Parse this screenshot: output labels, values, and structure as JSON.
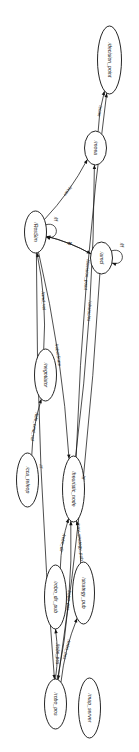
{
  "diagram": {
    "orientation": "rotated-90",
    "background_color": "#ffffff",
    "stroke_color": "#141414",
    "node_fill": "#ffffff",
    "nodes": [
      {
        "id": "decision_point",
        "label": "/decision_point",
        "cx": 60,
        "cy": 30,
        "rx": 34,
        "ry": 12
      },
      {
        "id": "moea",
        "label": "/moea",
        "cx": 148,
        "cy": 44,
        "rx": 17,
        "ry": 11
      },
      {
        "id": "amcl",
        "label": "/amcl",
        "cx": 258,
        "cy": 38,
        "rx": 16,
        "ry": 11
      },
      {
        "id": "RosSim",
        "label": "/RosSim",
        "cx": 232,
        "cy": 104,
        "rx": 21,
        "ry": 11
      },
      {
        "id": "negotiator",
        "label": "/negotiator",
        "cx": 375,
        "cy": 94,
        "rx": 26,
        "ry": 11
      },
      {
        "id": "heuristic_node",
        "label": "/heuristic_node",
        "cx": 489,
        "cy": 66,
        "rx": 33,
        "ry": 11
      },
      {
        "id": "cca_teleop",
        "label": "/cca_teleop",
        "cx": 480,
        "cy": 112,
        "rx": 27,
        "ry": 11
      },
      {
        "id": "strategy_pub",
        "label": "/strategy_pub",
        "cx": 593,
        "cy": 56,
        "rx": 31,
        "ry": 11
      },
      {
        "id": "robo_dir_pub",
        "label": "/robo_dir_pub",
        "cx": 597,
        "cy": 84,
        "rx": 32,
        "ry": 11
      },
      {
        "id": "map_server",
        "label": "/map_server",
        "cx": 708,
        "cy": 50,
        "rx": 30,
        "ry": 11
      },
      {
        "id": "robo_pos",
        "label": "/robo_pos",
        "cx": 704,
        "cy": 84,
        "rx": 25,
        "ry": 11
      }
    ],
    "edges": [
      {
        "id": "e1",
        "from": "moea",
        "to": "decision_point",
        "label": "/scan"
      },
      {
        "id": "e2",
        "from": "RosSim",
        "to": "moea",
        "label": "/scan"
      },
      {
        "id": "e3",
        "from": "amcl",
        "to": "amcl",
        "label": "/tf"
      },
      {
        "id": "e4",
        "from": "RosSim",
        "to": "RosSim",
        "label": "/tf"
      },
      {
        "id": "e5",
        "from": "RosSim",
        "to": "amcl",
        "label": "/tf"
      },
      {
        "id": "e6",
        "from": "amcl",
        "to": "RosSim",
        "label": "/tf"
      },
      {
        "id": "e7",
        "from": "heuristic_node",
        "to": "decision_point",
        "label": "/decision_point"
      },
      {
        "id": "e8",
        "from": "heuristic_node",
        "to": "moea",
        "label": "/obstacles"
      },
      {
        "id": "e9",
        "from": "RosSim",
        "to": "heuristic_node",
        "label": "/robotState"
      },
      {
        "id": "e10",
        "from": "negotiator",
        "to": "RosSim",
        "label": "/cmd_vel"
      },
      {
        "id": "e11",
        "from": "cca_teleop",
        "to": "negotiator",
        "label": "/tele_cmd_vel"
      },
      {
        "id": "e12",
        "from": "strategy_pub",
        "to": "heuristic_node",
        "label": "/nav_strategy_pub"
      },
      {
        "id": "e13",
        "from": "robo_dir_pub",
        "to": "heuristic_node",
        "label": "/robo_dir"
      },
      {
        "id": "e14",
        "from": "robo_pos",
        "to": "heuristic_node",
        "label": "/robo_pos"
      },
      {
        "id": "e15",
        "from": "robo_pos",
        "to": "strategy_pub",
        "label": "/robo_pos"
      },
      {
        "id": "e16",
        "from": "robo_pos",
        "to": "robo_dir_pub",
        "label": "/robo_pos"
      },
      {
        "id": "e17",
        "from": "amcl",
        "to": "robo_pos",
        "label": "/tf"
      },
      {
        "id": "e18",
        "from": "RosSim",
        "to": "robo_pos",
        "label": "/tf"
      }
    ]
  }
}
